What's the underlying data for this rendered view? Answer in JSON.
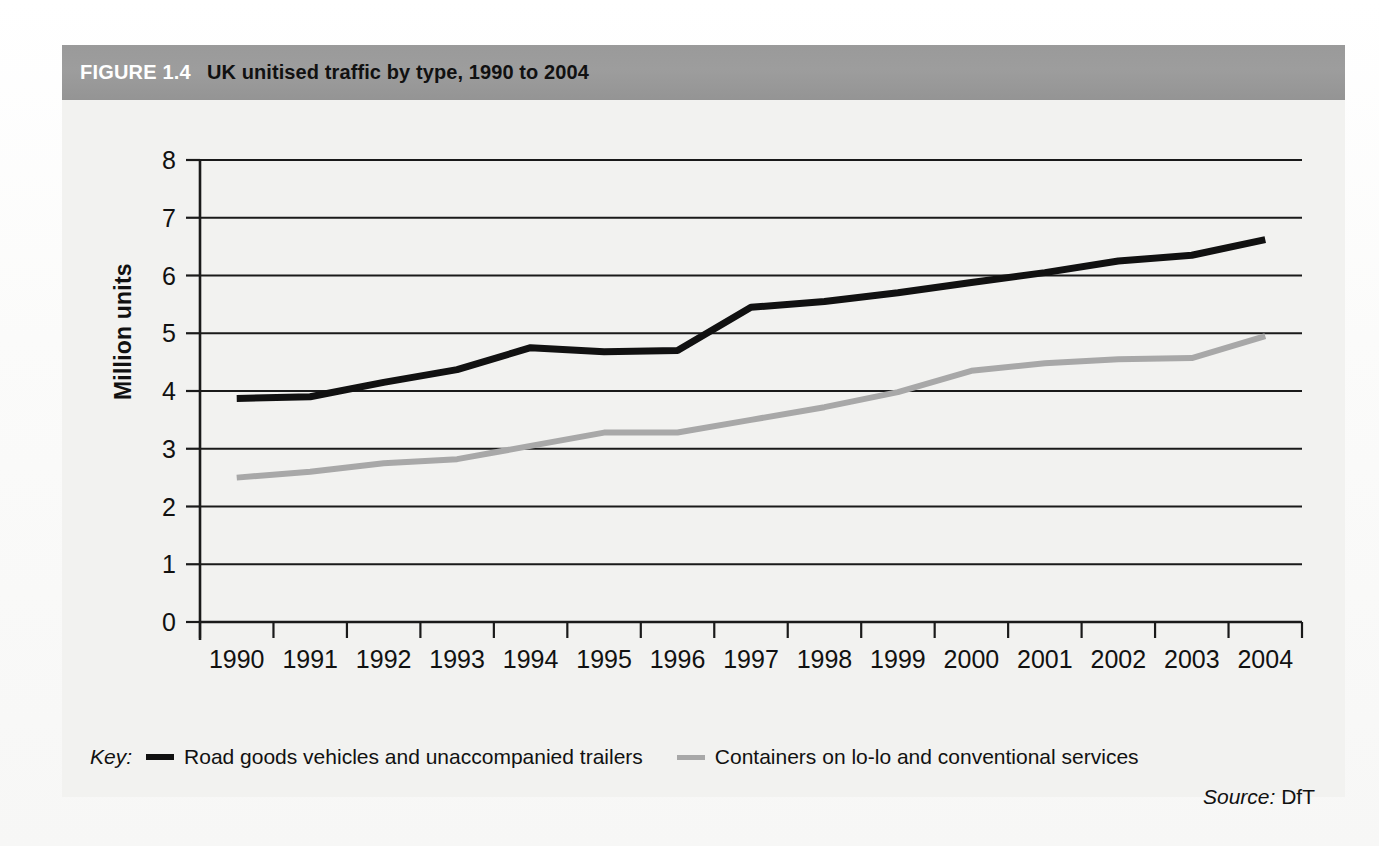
{
  "figure": {
    "number": "FIGURE 1.4",
    "title": "UK unitised traffic by type, 1990 to 2004"
  },
  "key": {
    "label": "Key:",
    "series": [
      {
        "name": "Road goods vehicles and unaccompanied trailers",
        "color": "#111111"
      },
      {
        "name": "Containers on lo-lo and conventional services",
        "color": "#a8a8a8"
      }
    ]
  },
  "source": {
    "label": "Source:",
    "value": "DfT"
  },
  "colors": {
    "header_band": "#9a9a9a",
    "panel": "#f2f2f0",
    "axis": "#1a1a1a",
    "series_black": "#111111",
    "series_gray": "#a8a8a8"
  },
  "chart_data": {
    "type": "line",
    "title": "UK unitised traffic by type, 1990 to 2004",
    "xlabel": "",
    "ylabel": "Million units",
    "ylim": [
      0,
      8
    ],
    "yticks": [
      "0",
      "1",
      "2",
      "3",
      "4",
      "5",
      "6",
      "7",
      "8"
    ],
    "grid": true,
    "legend_position": "bottom",
    "categories": [
      "1990",
      "1991",
      "1992",
      "1993",
      "1994",
      "1995",
      "1996",
      "1997",
      "1998",
      "1999",
      "2000",
      "2001",
      "2002",
      "2003",
      "2004"
    ],
    "series": [
      {
        "name": "Road goods vehicles and unaccompanied trailers",
        "color": "#111111",
        "values": [
          3.87,
          3.9,
          4.15,
          4.37,
          4.75,
          4.68,
          4.7,
          5.45,
          5.55,
          5.7,
          5.88,
          6.05,
          6.25,
          6.35,
          6.62
        ]
      },
      {
        "name": "Containers on lo-lo and conventional services",
        "color": "#a8a8a8",
        "values": [
          2.5,
          2.6,
          2.75,
          2.82,
          3.05,
          3.28,
          3.28,
          3.5,
          3.72,
          3.98,
          4.35,
          4.48,
          4.55,
          4.57,
          4.95
        ]
      }
    ]
  }
}
